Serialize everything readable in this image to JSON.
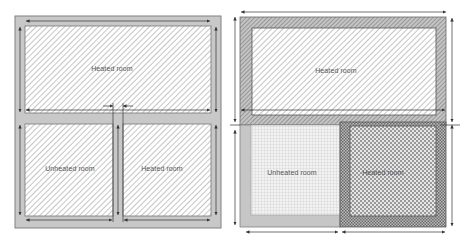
{
  "diagrams": [
    {
      "id": "left",
      "rooms": [
        {
          "label": "Heated room",
          "x": 112,
          "y": 68
        },
        {
          "label": "Unheated room",
          "x": 70,
          "y": 168
        },
        {
          "label": "Heated room",
          "x": 162,
          "y": 168
        }
      ]
    },
    {
      "id": "right",
      "rooms": [
        {
          "label": "Heated room",
          "x": 336,
          "y": 70
        },
        {
          "label": "Unheated room",
          "x": 292,
          "y": 172
        },
        {
          "label": "Heated room",
          "x": 383,
          "y": 172
        }
      ]
    }
  ],
  "colors": {
    "wall_fill": "#c8c8c8",
    "wall_edge": "#808080",
    "hatch_line": "#9a9a9a",
    "dim_line": "#333333",
    "label": "#555555"
  }
}
